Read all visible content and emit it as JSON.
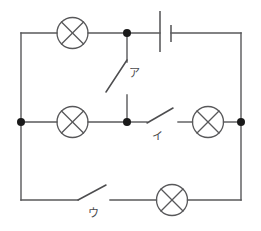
{
  "figure": {
    "background_color": "#ffffff",
    "line_color": "#58585a",
    "dot_color": "#1a1a1a",
    "width": 261,
    "height": 231
  },
  "labels": {
    "switch_a": "ア",
    "switch_b": "イ",
    "switch_c": "ウ"
  },
  "components": {
    "lamps": [
      {
        "name": "lamp-top-left",
        "cx": 72.5,
        "cy": 33,
        "r": 15.5
      },
      {
        "name": "lamp-middle-left",
        "cx": 72.5,
        "cy": 122,
        "r": 15.5
      },
      {
        "name": "lamp-middle-right",
        "cx": 208,
        "cy": 122,
        "r": 15.5
      },
      {
        "name": "lamp-bottom",
        "cx": 172,
        "cy": 200,
        "r": 15.5
      }
    ],
    "battery": {
      "name": "battery-cell",
      "long_plate_x": 160,
      "long_plate_y1": 11,
      "long_plate_y2": 52,
      "short_plate_x": 171,
      "short_plate_y1": 25,
      "short_plate_y2": 42
    },
    "switches": [
      {
        "name": "switch-a",
        "state": "open",
        "label": "ア"
      },
      {
        "name": "switch-b",
        "state": "open",
        "label": "イ"
      },
      {
        "name": "switch-c",
        "state": "open",
        "label": "ウ"
      }
    ],
    "junctions": [
      {
        "name": "junction-top-mid",
        "cx": 127,
        "cy": 33
      },
      {
        "name": "junction-mid-left",
        "cx": 21,
        "cy": 122
      },
      {
        "name": "junction-mid-center",
        "cx": 127,
        "cy": 122
      },
      {
        "name": "junction-mid-right",
        "cx": 241,
        "cy": 122
      }
    ]
  },
  "rails": {
    "left_x": 21,
    "right_x": 241,
    "top_y": 33,
    "middle_y": 122,
    "bottom_y": 200
  }
}
